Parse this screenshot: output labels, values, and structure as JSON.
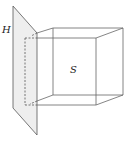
{
  "diagram": {
    "labels": {
      "plane": "H",
      "solid": "S"
    },
    "colors": {
      "line": "#555555",
      "plane_fill": "#eeeeee",
      "background": "#ffffff"
    }
  }
}
